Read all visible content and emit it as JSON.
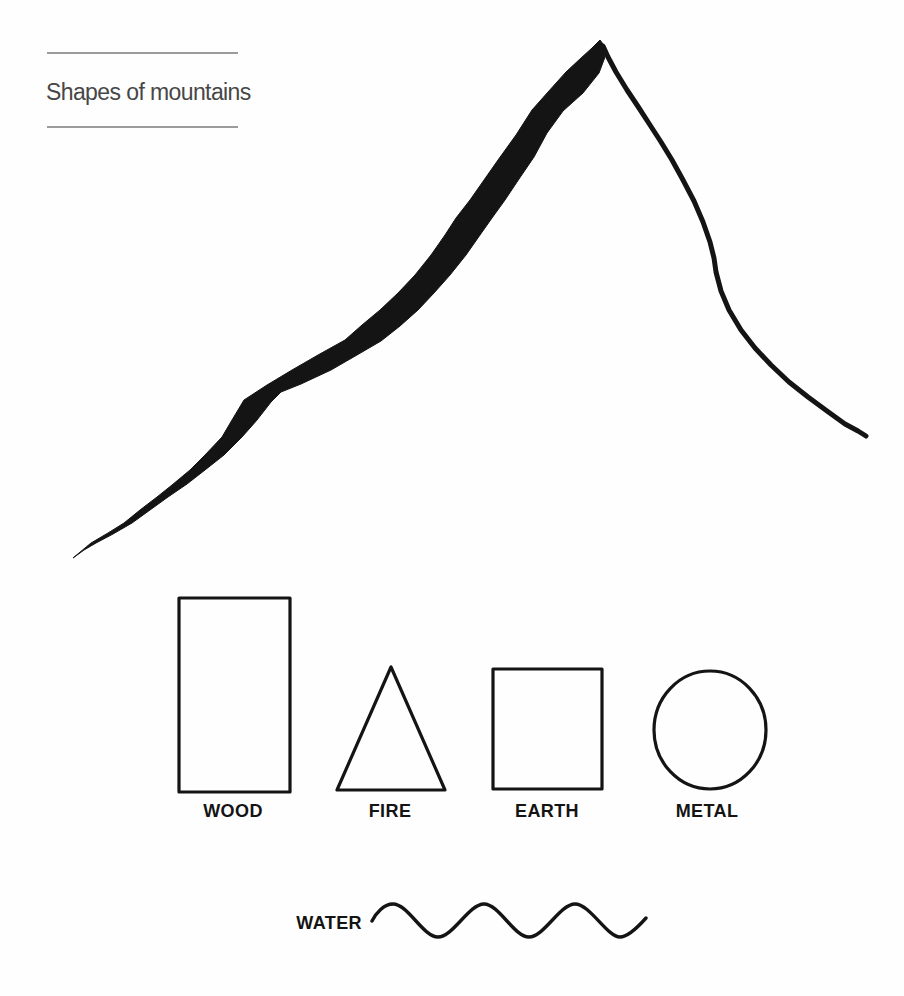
{
  "page": {
    "title": "Shapes of mountains"
  },
  "colors": {
    "ink": "#141414",
    "rule": "#9c9c9c",
    "title_text": "#474747",
    "background": "#fefefe"
  },
  "mountain": {
    "name": "hand-drawn mountain peak"
  },
  "elements": [
    {
      "label": "WOOD",
      "shape": "tall-rectangle"
    },
    {
      "label": "FIRE",
      "shape": "triangle"
    },
    {
      "label": "EARTH",
      "shape": "square"
    },
    {
      "label": "METAL",
      "shape": "circle"
    },
    {
      "label": "WATER",
      "shape": "wavy-line"
    }
  ]
}
